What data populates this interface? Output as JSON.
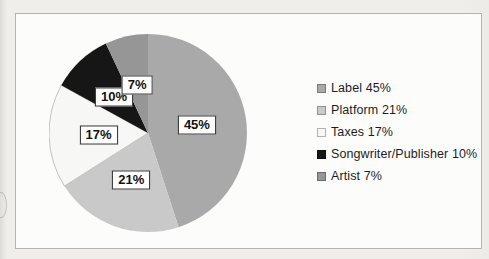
{
  "chart_data": {
    "type": "pie",
    "title": "",
    "direction": "clockwise",
    "start_angle_deg": 0,
    "legend_position": "right",
    "slices": [
      {
        "name": "Label",
        "value": 45,
        "data_label": "45%",
        "legend_label": "Label 45%",
        "color": "#a9a9a9"
      },
      {
        "name": "Platform",
        "value": 21,
        "data_label": "21%",
        "legend_label": "Platform 21%",
        "color": "#c9c9c9"
      },
      {
        "name": "Taxes",
        "value": 17,
        "data_label": "17%",
        "legend_label": "Taxes 17%",
        "color": "#f7f7f5",
        "edge": "#c2c2c0"
      },
      {
        "name": "Songwriter/Publisher",
        "value": 10,
        "data_label": "10%",
        "legend_label": "Songwriter/Publisher 10%",
        "color": "#161616"
      },
      {
        "name": "Artist",
        "value": 7,
        "data_label": "7%",
        "legend_label": "Artist 7%",
        "color": "#969696"
      }
    ],
    "data_label_style": {
      "background": "#ffffff",
      "border": "#3d3d3d",
      "text": "#121212"
    }
  }
}
